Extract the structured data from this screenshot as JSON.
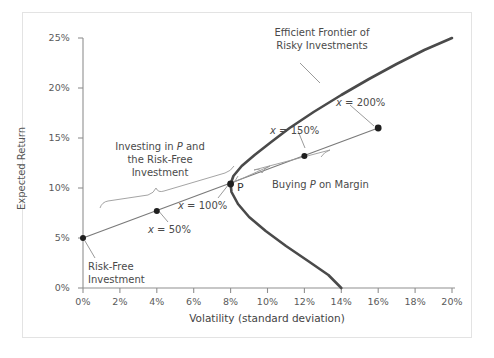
{
  "chart_data": {
    "type": "line",
    "title": "",
    "xlabel": "Volatility (standard deviation)",
    "ylabel": "Expected Return",
    "xlim": [
      0,
      20
    ],
    "ylim": [
      0,
      25
    ],
    "xticks": [
      "0%",
      "2%",
      "4%",
      "6%",
      "8%",
      "10%",
      "12%",
      "14%",
      "16%",
      "18%",
      "20%"
    ],
    "xtick_values": [
      0,
      2,
      4,
      6,
      8,
      10,
      12,
      14,
      16,
      18,
      20
    ],
    "yticks": [
      "0%",
      "5%",
      "10%",
      "15%",
      "20%",
      "25%"
    ],
    "ytick_values": [
      0,
      5,
      10,
      15,
      20,
      25
    ],
    "grid": false,
    "legend": "none",
    "series": [
      {
        "name": "Efficient Frontier of Risky Investments",
        "style": "thick-curve",
        "points": [
          [
            20.0,
            25.0
          ],
          [
            18.5,
            23.8
          ],
          [
            17.0,
            22.4
          ],
          [
            15.5,
            20.9
          ],
          [
            14.0,
            19.3
          ],
          [
            12.5,
            17.6
          ],
          [
            11.2,
            16.0
          ],
          [
            10.2,
            14.6
          ],
          [
            9.3,
            13.3
          ],
          [
            8.6,
            12.2
          ],
          [
            8.15,
            11.2
          ],
          [
            8.0,
            10.4
          ],
          [
            8.05,
            9.6
          ],
          [
            8.4,
            8.4
          ],
          [
            9.0,
            7.1
          ],
          [
            9.9,
            5.7
          ],
          [
            11.0,
            4.2
          ],
          [
            12.2,
            2.7
          ],
          [
            13.3,
            1.3
          ],
          [
            14.0,
            0.0
          ]
        ]
      },
      {
        "name": "Capital Market Line",
        "style": "thin-line",
        "points": [
          [
            0.0,
            5.0
          ],
          [
            16.0,
            16.0
          ]
        ]
      }
    ],
    "markers": [
      {
        "label": "Risk-Free Investment",
        "x": 0.0,
        "y": 5.0
      },
      {
        "label": "x = 50%",
        "x": 4.0,
        "y": 7.7
      },
      {
        "label": "P",
        "x": 8.0,
        "y": 10.4
      },
      {
        "label": "x = 150%",
        "x": 12.0,
        "y": 13.2
      },
      {
        "label": "x = 200%",
        "x": 16.0,
        "y": 16.0
      }
    ],
    "annotations": [
      {
        "name": "efficient-frontier",
        "text": "Efficient Frontier of Risky Investments"
      },
      {
        "name": "investing-in-p",
        "text": "Investing in P and the Risk-Free Investment"
      },
      {
        "name": "buying-on-margin",
        "text": "Buying P on Margin"
      },
      {
        "name": "risk-free-investment",
        "text": "Risk-Free Investment"
      },
      {
        "name": "x-50",
        "text": "x = 50%"
      },
      {
        "name": "x-100",
        "text": "x = 100%"
      },
      {
        "name": "x-150",
        "text": "x = 150%"
      },
      {
        "name": "x-200",
        "text": "x = 200%"
      },
      {
        "name": "point-p",
        "text": "P"
      }
    ]
  },
  "axes": {
    "y_title": "Expected Return",
    "x_title": "Volatility (standard deviation)",
    "y_ticks": [
      "25%",
      "20%",
      "15%",
      "10%",
      "5%",
      "0%"
    ],
    "x_ticks": [
      "0%",
      "2%",
      "4%",
      "6%",
      "8%",
      "10%",
      "12%",
      "14%",
      "16%",
      "18%",
      "20%"
    ]
  },
  "annotations": {
    "frontier_line1": "Efficient Frontier of",
    "frontier_line2": "Risky Investments",
    "investing_line1_a": "Investing in ",
    "investing_line1_p": "P",
    "investing_line1_b": " and",
    "investing_line2": "the Risk-Free",
    "investing_line3": "Investment",
    "margin_a": "Buying ",
    "margin_p": "P",
    "margin_b": " on Margin",
    "riskfree_line1": "Risk-Free",
    "riskfree_line2": "Investment",
    "x50_x": "x",
    "x50_rest": " = 50%",
    "x100_x": "x",
    "x100_rest": " = 100%",
    "x150_x": "x",
    "x150_rest": " = 150%",
    "x200_x": "x",
    "x200_rest": " = 200%",
    "point_p": "P"
  },
  "colors": {
    "frontier": "#4a4a4a",
    "cml": "#7a7a7a",
    "axis": "#8a8a8a",
    "text": "#555555",
    "marker": "#1f1f1f",
    "border": "#e3e3e3"
  }
}
